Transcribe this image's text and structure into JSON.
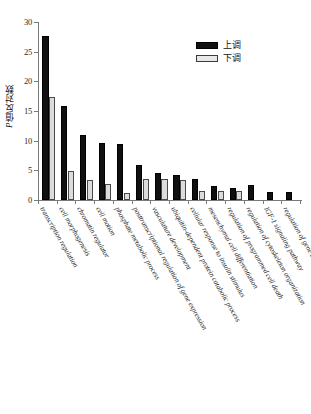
{
  "chart_data": {
    "type": "bar",
    "title": "",
    "xlabel": "",
    "ylabel": "P值反对数",
    "ylim": [
      0,
      30
    ],
    "yticks": [
      0,
      5,
      10,
      15,
      20,
      25,
      30
    ],
    "grid": false,
    "legend_position": "top-right",
    "categories": [
      "transcription regulation",
      "cell morphogenesis",
      "chromatin regulator",
      "cell motion",
      "phosphate metabolic process",
      "posttranscriptional regulation of gene expression",
      "vasculature development",
      "ubiquitin-dependent protein catabolic process",
      "cellular response to insulin stimulus",
      "mesenchymal cell differentiation",
      "regulation of programmed cell death",
      "regulation of cytoskeleton organization",
      "IGF-1 signaling pathway",
      "regulation of gene expression, epigenetic"
    ],
    "series": [
      {
        "name": "上调",
        "color": "#101010",
        "values": [
          27.7,
          15.9,
          10.9,
          9.6,
          9.4,
          5.9,
          4.5,
          4.3,
          3.6,
          2.4,
          2.1,
          2.6,
          1.3,
          1.3
        ]
      },
      {
        "name": "下调",
        "color": "#dcdcdc",
        "values": [
          17.3,
          4.9,
          3.4,
          2.7,
          1.1,
          3.6,
          3.5,
          3.3,
          1.5,
          1.6,
          1.5,
          0,
          0,
          0
        ]
      }
    ]
  },
  "legend": {
    "entries": [
      {
        "label": "上调"
      },
      {
        "label": "下调"
      }
    ]
  },
  "axis": {
    "y_title_prefix": "P",
    "y_title_rest": "值反对数"
  }
}
